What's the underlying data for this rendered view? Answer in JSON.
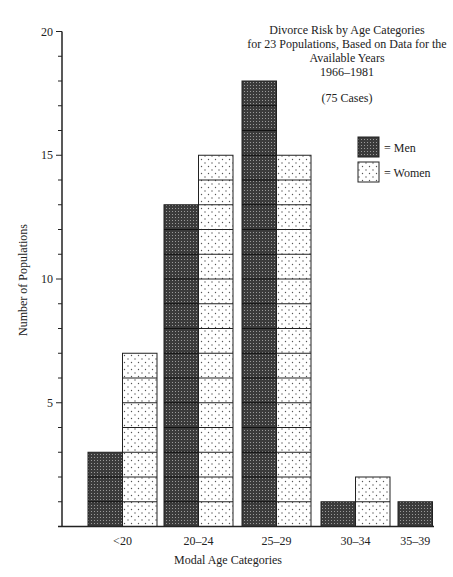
{
  "chart_data": {
    "type": "bar",
    "title": "Divorce Risk by Age Categories for 23 Populations, Based on Data for the Available Years 1966–1981",
    "title_lines": [
      "Divorce Risk by Age Categories",
      "for 23 Populations, Based on Data for the",
      "Available Years",
      "1966–1981"
    ],
    "subtitle": "(75 Cases)",
    "xlabel": "Modal Age Categories",
    "ylabel": "Number of Populations",
    "categories": [
      "<20",
      "20–24",
      "25–29",
      "30–34",
      "35–39"
    ],
    "series": [
      {
        "name": "Men",
        "legend_label": "= Men",
        "pattern": "dense-dark-dots",
        "color": "#3a3a3a",
        "values": [
          3,
          13,
          18,
          1,
          1
        ]
      },
      {
        "name": "Women",
        "legend_label": "= Women",
        "pattern": "sparse-light-dots",
        "color": "#ffffff",
        "values": [
          7,
          15,
          15,
          2,
          0
        ]
      }
    ],
    "yticks": [
      5,
      10,
      15,
      20
    ],
    "ylim": [
      0,
      20
    ],
    "grid": false,
    "legend_position": "upper right"
  }
}
